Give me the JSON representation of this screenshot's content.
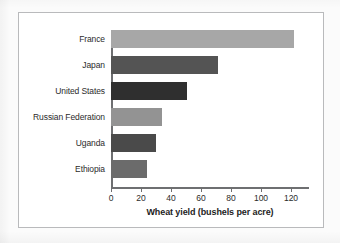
{
  "figure": {
    "frame_color": "#b9babc",
    "background": "#ffffff",
    "axis_color": "#6e6f71"
  },
  "chart_data": {
    "type": "bar",
    "orientation": "horizontal",
    "title": "",
    "xlabel": "Wheat yield (bushels per acre)",
    "ylabel": "",
    "xlim": [
      0,
      120
    ],
    "xticks": [
      0,
      20,
      40,
      60,
      80,
      100,
      120
    ],
    "xtick_labels": [
      "0",
      "20",
      "40",
      "60",
      "80",
      "100",
      "120"
    ],
    "grid": false,
    "legend": false,
    "categories": [
      "France",
      "Japan",
      "United States",
      "Russian Federation",
      "Uganda",
      "Ethiopia"
    ],
    "values": [
      111,
      65,
      46,
      31,
      27,
      22
    ],
    "bar_colors": [
      "#a7a7a7",
      "#545454",
      "#2f2f2f",
      "#939393",
      "#4a4a4a",
      "#6b6b6b"
    ]
  }
}
